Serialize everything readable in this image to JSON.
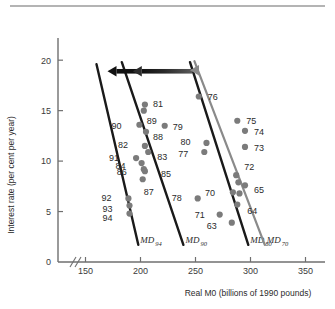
{
  "figure": {
    "top_rule": true,
    "background": "#ffffff"
  },
  "chart_data": {
    "type": "scatter",
    "title": "",
    "subtitle": "",
    "xlabel": "Real M0 (billions of 1990 pounds)",
    "ylabel": "Interest rate (per cent per year)",
    "xlim": [
      125,
      365
    ],
    "ylim": [
      0,
      22
    ],
    "axis_break": true,
    "grid": false,
    "legend": "none",
    "xticks": [
      150,
      200,
      250,
      300,
      350
    ],
    "xtick_labels": [
      "150",
      "200",
      "250",
      "300",
      "350"
    ],
    "yticks": [
      0,
      5,
      10,
      15,
      20
    ],
    "ytick_labels": [
      "0",
      "5",
      "10",
      "15",
      "20"
    ],
    "marker_color": "#7b7b7b",
    "line_color_dark": "#1a1a1a",
    "line_color_gray": "#8a8a8a",
    "points": [
      {
        "label": "81",
        "x": 204,
        "y": 15.6,
        "lx": 8,
        "ly": -1
      },
      {
        "label": "89",
        "x": 203,
        "y": 15.0,
        "lx": 3,
        "ly": 10
      },
      {
        "label": "90",
        "x": 199,
        "y": 13.6,
        "lx": -18,
        "ly": 1
      },
      {
        "label": "79",
        "x": 222,
        "y": 13.5,
        "lx": 8,
        "ly": 1
      },
      {
        "label": "88",
        "x": 205,
        "y": 12.9,
        "lx": 7,
        "ly": 5
      },
      {
        "label": "82",
        "x": 204,
        "y": 11.5,
        "lx": -17,
        "ly": -1
      },
      {
        "label": "83",
        "x": 207,
        "y": 10.9,
        "lx": 9,
        "ly": 5
      },
      {
        "label": "91",
        "x": 196,
        "y": 10.3,
        "lx": -17,
        "ly": 0
      },
      {
        "label": "84",
        "x": 201,
        "y": 9.8,
        "lx": -16,
        "ly": 3
      },
      {
        "label": "86",
        "x": 203,
        "y": 9.2,
        "lx": -17,
        "ly": 3
      },
      {
        "label": "85",
        "x": 204,
        "y": 9.0,
        "lx": 16,
        "ly": 3
      },
      {
        "label": "87",
        "x": 202,
        "y": 8.2,
        "lx": 1,
        "ly": 13
      },
      {
        "label": "92",
        "x": 189,
        "y": 6.3,
        "lx": -17,
        "ly": -1
      },
      {
        "label": "93",
        "x": 190,
        "y": 5.6,
        "lx": -17,
        "ly": 3
      },
      {
        "label": "94",
        "x": 190,
        "y": 4.8,
        "lx": -17,
        "ly": 4
      },
      {
        "label": "76",
        "x": 253,
        "y": 16.4,
        "lx": 9,
        "ly": 0
      },
      {
        "label": "75",
        "x": 288,
        "y": 14.0,
        "lx": 9,
        "ly": 0
      },
      {
        "label": "74",
        "x": 295,
        "y": 13.0,
        "lx": 9,
        "ly": 1
      },
      {
        "label": "73",
        "x": 295,
        "y": 11.4,
        "lx": 9,
        "ly": 1
      },
      {
        "label": "80",
        "x": 260,
        "y": 11.8,
        "lx": -16,
        "ly": -1
      },
      {
        "label": "77",
        "x": 258,
        "y": 10.9,
        "lx": -16,
        "ly": 2
      },
      {
        "label": "72",
        "x": 287,
        "y": 8.6,
        "lx": 8,
        "ly": -8
      },
      {
        "label": "72b",
        "x": 289,
        "y": 7.9,
        "lx": 0,
        "ly": 0,
        "hide_label": true
      },
      {
        "label": "65",
        "x": 295,
        "y": 7.6,
        "lx": 9,
        "ly": 4
      },
      {
        "label": "70",
        "x": 284,
        "y": 6.9,
        "lx": -18,
        "ly": 0
      },
      {
        "label": "70b",
        "x": 290,
        "y": 6.8,
        "lx": 0,
        "ly": 0,
        "hide_label": true
      },
      {
        "label": "64",
        "x": 288,
        "y": 5.7,
        "lx": 10,
        "ly": 6
      },
      {
        "label": "78",
        "x": 252,
        "y": 6.3,
        "lx": -16,
        "ly": -1
      },
      {
        "label": "71",
        "x": 272,
        "y": 4.7,
        "lx": -15,
        "ly": 0
      },
      {
        "label": "63",
        "x": 283,
        "y": 3.9,
        "lx": -15,
        "ly": 3
      }
    ],
    "md_lines": [
      {
        "name": "MD",
        "sub": "94",
        "color": "dark",
        "x_top": 160,
        "y_top": 19.6,
        "x_bot": 198,
        "y_bot": 1.7
      },
      {
        "name": "MD",
        "sub": "90",
        "color": "dark",
        "x_top": 183,
        "y_top": 19.8,
        "x_bot": 239,
        "y_bot": 1.7
      },
      {
        "name": "MD",
        "sub": "80",
        "color": "dark",
        "x_top": 245,
        "y_top": 19.8,
        "x_bot": 298,
        "y_bot": 1.7
      },
      {
        "name": "MD",
        "sub": "70",
        "color": "gray",
        "x_top": 249,
        "y_top": 19.9,
        "x_bot": 313,
        "y_bot": 1.7
      }
    ],
    "arrows": [
      {
        "name": "short-black-arrow",
        "color": "#111111",
        "x_from": 198,
        "y": 18.9,
        "x_to": 170
      },
      {
        "name": "long-gradient-arrow",
        "color": "#2c2c2c",
        "x_from": 247,
        "y": 18.9,
        "x_to": 193
      },
      {
        "name": "gray-arrowhead",
        "color": "#8a8a8a",
        "x_from": 253,
        "y": 19.0,
        "x_to": 245
      }
    ]
  }
}
